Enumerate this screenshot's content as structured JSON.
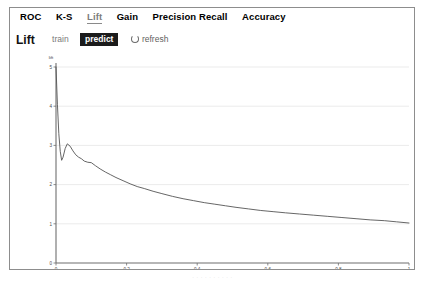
{
  "tabs": [
    {
      "label": "ROC",
      "active": false
    },
    {
      "label": "K-S",
      "active": false
    },
    {
      "label": "Lift",
      "active": true
    },
    {
      "label": "Gain",
      "active": false
    },
    {
      "label": "Precision Recall",
      "active": false
    },
    {
      "label": "Accuracy",
      "active": false
    }
  ],
  "toolbar": {
    "title": "Lift",
    "dataset_options": [
      {
        "label": "train",
        "selected": false
      },
      {
        "label": "predict",
        "selected": true
      }
    ],
    "refresh_label": "refresh",
    "refresh_icon": "refresh-icon"
  },
  "footer": {
    "artifact_text": "· ·  · · · · ·  · · ·"
  },
  "colors": {
    "panel_border": "#8d8d8d",
    "selected_bg": "#1b1b1b",
    "selected_fg": "#ffffff",
    "curve": "#555555",
    "grid": "#e2e2e2",
    "axis": "#6f6f6f",
    "active_tab": "#7d7d7d"
  },
  "chart_data": {
    "type": "line",
    "title": "Lift",
    "xlabel": "",
    "ylabel": "lift",
    "xlim": [
      0,
      1
    ],
    "ylim": [
      0,
      5
    ],
    "grid": true,
    "legend": "none",
    "xticks": [
      "0",
      "0.2",
      "0.4",
      "0.6",
      "0.8",
      "1"
    ],
    "xtick_values": [
      0,
      0.2,
      0.4,
      0.6,
      0.8,
      1
    ],
    "yticks": [
      "0",
      "1",
      "2",
      "3",
      "4",
      "5"
    ],
    "ytick_values": [
      0,
      1,
      2,
      3,
      4,
      5
    ],
    "series": [
      {
        "name": "predict",
        "color": "#555555",
        "x": [
          0.0,
          0.004,
          0.008,
          0.012,
          0.016,
          0.02,
          0.026,
          0.032,
          0.04,
          0.048,
          0.056,
          0.064,
          0.072,
          0.08,
          0.09,
          0.1,
          0.112,
          0.125,
          0.14,
          0.155,
          0.17,
          0.19,
          0.21,
          0.23,
          0.25,
          0.275,
          0.3,
          0.33,
          0.36,
          0.39,
          0.42,
          0.45,
          0.48,
          0.51,
          0.545,
          0.58,
          0.615,
          0.65,
          0.69,
          0.73,
          0.77,
          0.81,
          0.85,
          0.89,
          0.93,
          0.965,
          1.0
        ],
        "y": [
          5.0,
          4.05,
          3.3,
          2.85,
          2.62,
          2.7,
          2.92,
          3.04,
          2.98,
          2.86,
          2.76,
          2.7,
          2.66,
          2.6,
          2.57,
          2.56,
          2.48,
          2.4,
          2.32,
          2.25,
          2.18,
          2.1,
          2.02,
          1.95,
          1.9,
          1.83,
          1.77,
          1.7,
          1.64,
          1.59,
          1.54,
          1.5,
          1.46,
          1.42,
          1.38,
          1.34,
          1.31,
          1.28,
          1.25,
          1.22,
          1.19,
          1.16,
          1.13,
          1.1,
          1.08,
          1.05,
          1.02
        ]
      }
    ]
  }
}
